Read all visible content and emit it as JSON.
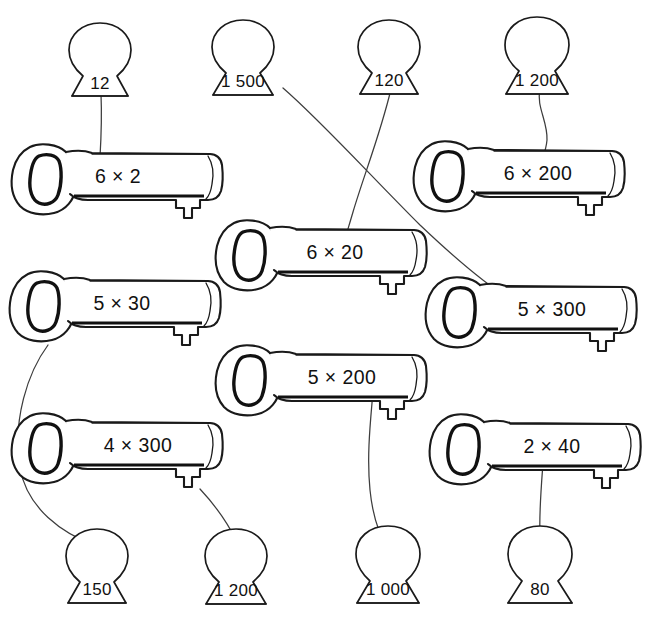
{
  "worksheet": {
    "title": "Keys and keyholes multiplication matching",
    "background_color": "#ffffff",
    "ink_color": "#1a1a1a",
    "link_color": "#3d3d3d",
    "width": 650,
    "height": 619
  },
  "keys": [
    {
      "id": "key-6x2",
      "label": "6 × 2",
      "x": 14,
      "y": 143,
      "width": 216,
      "answer": "12"
    },
    {
      "id": "key-6x200",
      "label": "6 × 200",
      "x": 416,
      "y": 140,
      "width": 216,
      "answer": "1 200"
    },
    {
      "id": "key-6x20",
      "label": "6 × 20",
      "x": 218,
      "y": 219,
      "width": 216,
      "answer": "120"
    },
    {
      "id": "key-5x30",
      "label": "5 × 30",
      "x": 12,
      "y": 270,
      "width": 216,
      "answer": "150"
    },
    {
      "id": "key-5x300",
      "label": "5 × 300",
      "x": 428,
      "y": 276,
      "width": 216,
      "answer": "1 500"
    },
    {
      "id": "key-5x200",
      "label": "5 × 200",
      "x": 218,
      "y": 344,
      "width": 216,
      "answer": "1 000"
    },
    {
      "id": "key-4x300",
      "label": "4 × 300",
      "x": 14,
      "y": 412,
      "width": 216,
      "answer": "1 200"
    },
    {
      "id": "key-2x40",
      "label": "2 × 40",
      "x": 432,
      "y": 413,
      "width": 216,
      "answer": "80"
    }
  ],
  "keyholes": [
    {
      "id": "hole-12",
      "label": "12",
      "cx": 100,
      "cy": 55,
      "row": "top"
    },
    {
      "id": "hole-1500",
      "label": "1 500",
      "cx": 243,
      "cy": 52,
      "row": "top"
    },
    {
      "id": "hole-120",
      "label": "120",
      "cx": 389,
      "cy": 52,
      "row": "top"
    },
    {
      "id": "hole-1200t",
      "label": "1 200",
      "cx": 537,
      "cy": 50,
      "row": "top"
    },
    {
      "id": "hole-150",
      "label": "150",
      "cx": 97,
      "cy": 562,
      "row": "bottom"
    },
    {
      "id": "hole-1200b",
      "label": "1 200",
      "cx": 236,
      "cy": 562,
      "row": "bottom"
    },
    {
      "id": "hole-1000",
      "label": "1 000",
      "cx": 388,
      "cy": 560,
      "row": "bottom"
    },
    {
      "id": "hole-80",
      "label": "80",
      "cx": 540,
      "cy": 560,
      "row": "bottom"
    }
  ],
  "connections": [
    {
      "id": "link-12",
      "from_key": "key-6x2",
      "to_hole": "hole-12",
      "from_label": "6 × 2",
      "to_label": "12"
    },
    {
      "id": "link-1200t",
      "from_key": "key-6x200",
      "to_hole": "hole-1200t",
      "from_label": "6 × 200",
      "to_label": "1 200"
    },
    {
      "id": "link-120",
      "from_key": "key-6x20",
      "to_hole": "hole-120",
      "from_label": "6 × 20",
      "to_label": "120"
    },
    {
      "id": "link-1500",
      "from_key": "key-5x300",
      "to_hole": "hole-1500",
      "from_label": "5 × 300",
      "to_label": "1 500"
    },
    {
      "id": "link-150",
      "from_key": "key-5x30",
      "to_hole": "hole-150",
      "from_label": "5 × 30",
      "to_label": "150"
    },
    {
      "id": "link-1000",
      "from_key": "key-5x200",
      "to_hole": "hole-1000",
      "from_label": "5 × 200",
      "to_label": "1 000"
    },
    {
      "id": "link-1200b",
      "from_key": "key-4x300",
      "to_hole": "hole-1200b",
      "from_label": "4 × 300",
      "to_label": "1 200"
    },
    {
      "id": "link-80",
      "from_key": "key-2x40",
      "to_hole": "hole-80",
      "from_label": "2 × 40",
      "to_label": "80"
    }
  ]
}
